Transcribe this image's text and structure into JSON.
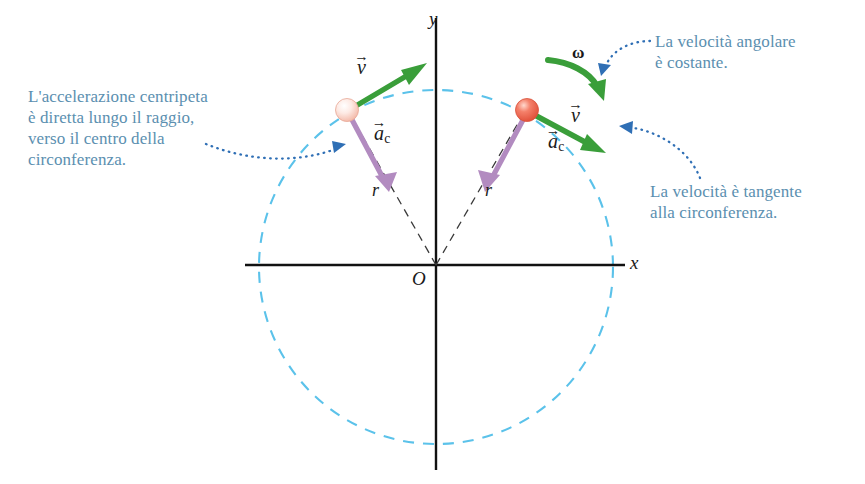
{
  "figure": {
    "type": "physics-diagram",
    "background_color": "#ffffff"
  },
  "colors": {
    "callout_text": "#5b8fb0",
    "circle_dashed": "#5bc2ea",
    "leader_dotted": "#2f6fb5",
    "velocity_arrow": "#3a9e3a",
    "acceleration_arrow": "#b28bc0",
    "radius_dashed": "#3a3a3a",
    "axis": "#111111",
    "ball_left": "#fbe3dc",
    "ball_right": "#f0604a"
  },
  "axes": {
    "x_label": "x",
    "y_label": "y",
    "origin_label": "O"
  },
  "labels": {
    "radius_left": "r",
    "radius_right": "r",
    "omega": "ω",
    "velocity_symbol": "v",
    "velocity_arrow_glyph": "→",
    "acceleration_symbol": "a",
    "acceleration_subscript": "c"
  },
  "callouts": [
    {
      "id": "acceleration",
      "text": "L'accelerazione centripeta\nè diretta lungo il raggio,\nverso il centro della\ncirconferenza."
    },
    {
      "id": "angular-velocity",
      "text": "La velocità angolare\nè costante."
    },
    {
      "id": "tangential-velocity",
      "text": "La velocità è tangente\nalla circonferenza."
    }
  ],
  "geometry": {
    "center": {
      "x": 436,
      "y": 267
    },
    "radius": 177,
    "x_axis": {
      "x1": 245,
      "x2": 625,
      "y": 265
    },
    "y_axis": {
      "x": 436,
      "y1": 18,
      "y2": 470
    },
    "particles": [
      {
        "id": "left",
        "x": 347,
        "y": 110
      },
      {
        "id": "right",
        "x": 527,
        "y": 110
      }
    ]
  }
}
